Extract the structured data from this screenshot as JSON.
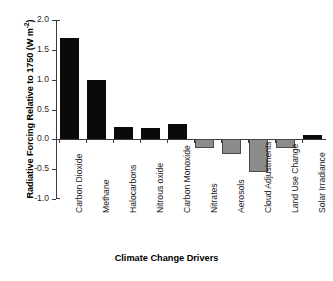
{
  "chart_data": {
    "type": "bar",
    "title": "",
    "subtitle": "",
    "xlabel": "Climate Change Drivers",
    "ylabel": "Radiative Forcing Relative to 1750 (W m",
    "ylabel_exponent": "-2",
    "ylabel_suffix": ")",
    "ylabel_full": "Radiative Forcing Relative to 1750 (W m-2)",
    "categories": [
      "Carbon Dioxide",
      "Methane",
      "Halocarbons",
      "Nitrous oxide",
      "Carbon Monoxide",
      "Nitrates",
      "Aerosols",
      "Cloud Adjustments",
      "Land Use Change",
      "Solar Irradiance"
    ],
    "values": [
      1.7,
      0.99,
      0.2,
      0.19,
      0.25,
      -0.15,
      -0.25,
      -0.55,
      -0.15,
      0.08
    ],
    "bar_colors": [
      "#0a0a0a",
      "#0a0a0a",
      "#0a0a0a",
      "#0a0a0a",
      "#0a0a0a",
      "#8c8c8c",
      "#8c8c8c",
      "#8c8c8c",
      "#8c8c8c",
      "#0a0a0a"
    ],
    "ylim": [
      -1.0,
      2.0
    ],
    "yticks": [
      2.0,
      1.5,
      1.0,
      0.5,
      0.0,
      -0.5,
      -1.0
    ],
    "ytick_labels": [
      "2.0",
      "1.5",
      "1.0",
      "0.5",
      "0.0",
      "-0.5",
      "-1.0"
    ],
    "grid": false,
    "legend": "none",
    "positive_color": "#0a0a0a",
    "negative_color": "#8c8c8c",
    "axis_color": "#3b3b3b",
    "background": "#ffffff"
  }
}
